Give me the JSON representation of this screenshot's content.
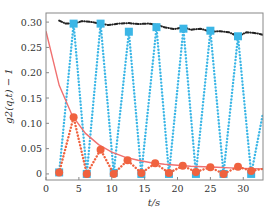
{
  "chart_data": {
    "type": "line",
    "title": "",
    "xlabel": "t/s",
    "ylabel": "g2(q,t) − 1",
    "xlim": [
      0,
      33
    ],
    "ylim": [
      -0.012,
      0.318
    ],
    "xticks": [
      0,
      5,
      10,
      15,
      20,
      25,
      30
    ],
    "xtick_labels": [
      "0",
      "5",
      "10",
      "15",
      "20",
      "25",
      "30"
    ],
    "yticks": [
      0,
      0.05,
      0.1,
      0.15,
      0.2,
      0.25,
      0.3
    ],
    "ytick_labels": [
      "0",
      "0.05",
      "0.10",
      "0.15",
      "0.20",
      "0.25",
      "0.30"
    ],
    "grid": false,
    "legend": null,
    "series": [
      {
        "name": "blue squares (dotted)",
        "color": "#3bb6e6",
        "style": "dotted",
        "marker": "square",
        "x": [
          2.0,
          4.2,
          6.2,
          8.3,
          10.3,
          12.6,
          14.5,
          16.8,
          18.7,
          20.9,
          22.8,
          25.0,
          27.0,
          29.2,
          31.2,
          33.0
        ],
        "y": [
          0.003,
          0.297,
          0.0,
          0.297,
          0.002,
          0.281,
          0.0,
          0.29,
          0.0,
          0.287,
          0.0,
          0.283,
          0.0,
          0.272,
          0.0,
          0.12
        ]
      },
      {
        "name": "orange circles (dotted)",
        "color": "#f0623f",
        "style": "dotted",
        "marker": "circle",
        "x": [
          2.0,
          4.2,
          6.2,
          8.3,
          10.3,
          12.4,
          14.5,
          16.6,
          18.7,
          20.8,
          22.8,
          25.0,
          27.0,
          29.2,
          31.2,
          33.0
        ],
        "y": [
          0.003,
          0.112,
          0.0,
          0.048,
          0.0,
          0.027,
          0.002,
          0.021,
          0.002,
          0.016,
          0.004,
          0.013,
          0.0,
          0.014,
          0.006,
          0.01
        ]
      },
      {
        "name": "decay fit (solid)",
        "color": "#f07070",
        "style": "solid",
        "marker": "none",
        "x": [
          0,
          2,
          4,
          6,
          8,
          10,
          12,
          14,
          16,
          18,
          20,
          22,
          24,
          26,
          28,
          30,
          33
        ],
        "y": [
          0.282,
          0.175,
          0.115,
          0.08,
          0.058,
          0.043,
          0.033,
          0.027,
          0.022,
          0.019,
          0.017,
          0.015,
          0.014,
          0.013,
          0.012,
          0.011,
          0.01
        ]
      },
      {
        "name": "envelope (dash-dot)",
        "color": "#222222",
        "style": "dashdot",
        "marker": "none",
        "x": [
          2.0,
          3.0,
          4.2,
          5.5,
          7.0,
          8.3,
          9.5,
          11.0,
          12.6,
          14.0,
          15.5,
          16.8,
          18.0,
          19.5,
          20.9,
          22.0,
          23.5,
          25.0,
          26.5,
          27.8,
          29.2,
          30.5,
          32.0,
          33.0
        ],
        "y": [
          0.303,
          0.297,
          0.297,
          0.302,
          0.3,
          0.297,
          0.294,
          0.297,
          0.298,
          0.296,
          0.297,
          0.295,
          0.29,
          0.286,
          0.29,
          0.285,
          0.287,
          0.281,
          0.282,
          0.28,
          0.272,
          0.28,
          0.278,
          0.275
        ]
      }
    ]
  }
}
